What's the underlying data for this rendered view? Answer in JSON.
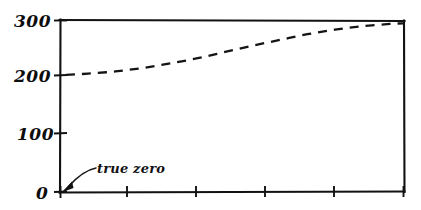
{
  "chart_data": {
    "type": "line",
    "title": "",
    "subtitle": "",
    "xlabel": "",
    "ylabel": "",
    "style": "hand-drawn",
    "line_style": "dashed",
    "grid": false,
    "legend": null,
    "ylim": [
      0,
      300
    ],
    "y_ticks": [
      0,
      100,
      200,
      300
    ],
    "y_tick_labels": [
      "0",
      "100",
      "200",
      "300"
    ],
    "x_ticks": [
      0,
      1,
      2,
      3,
      4,
      5
    ],
    "x_tick_labels": [
      "",
      "",
      "",
      "",
      "",
      ""
    ],
    "xlim": [
      0,
      5
    ],
    "series": [
      {
        "name": "",
        "x": [
          0.08,
          0.4,
          0.8,
          1.2,
          1.6,
          2.0,
          2.4,
          2.8,
          3.2,
          3.6,
          4.0,
          4.4,
          4.8,
          5.0
        ],
        "values": [
          205,
          207,
          211,
          217,
          225,
          234,
          245,
          256,
          266,
          276,
          284,
          290,
          294,
          295
        ]
      }
    ],
    "annotations": [
      {
        "text": "true zero",
        "target_x": 0,
        "target_y": 0,
        "kind": "arrow-callout"
      }
    ]
  },
  "axis": {
    "y_labels": {
      "t300": "300",
      "t200": "200",
      "t100": "100",
      "t0": "0"
    }
  },
  "annotation": {
    "true_zero_label": "true zero"
  },
  "colors": {
    "ink": "#141414",
    "background": "#ffffff"
  }
}
